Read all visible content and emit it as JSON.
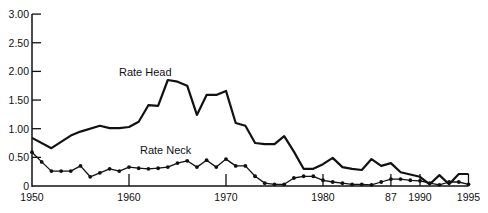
{
  "chart_data": {
    "type": "line",
    "title": "",
    "xlabel": "",
    "ylabel": "",
    "xlim": [
      1950,
      1995
    ],
    "ylim": [
      0,
      3.0
    ],
    "grid": false,
    "legend_position": "inline labels",
    "y_ticks": [
      "0",
      "0.50",
      "1.00",
      "1.50",
      "2.00",
      "2.50",
      "3.00"
    ],
    "x_ticks": [
      {
        "year": 1950,
        "label": "1950"
      },
      {
        "year": 1960,
        "label": "1960"
      },
      {
        "year": 1970,
        "label": "1970"
      },
      {
        "year": 1980,
        "label": "1980"
      },
      {
        "year": 1987,
        "label": "87"
      },
      {
        "year": 1990,
        "label": "1990"
      },
      {
        "year": 1995,
        "label": "1995"
      }
    ],
    "series": [
      {
        "name": "Rate Head",
        "markers": false,
        "x": [
          1950,
          1952,
          1954,
          1955,
          1957,
          1958,
          1959,
          1960,
          1961,
          1962,
          1963,
          1964,
          1965,
          1966,
          1967,
          1968,
          1969,
          1970,
          1971,
          1972,
          1973,
          1974,
          1975,
          1976,
          1977,
          1978,
          1979,
          1980,
          1981,
          1982,
          1983,
          1984,
          1985,
          1986,
          1987,
          1988,
          1989,
          1990,
          1991,
          1992,
          1993,
          1994,
          1995
        ],
        "values": [
          0.84,
          0.66,
          0.88,
          0.95,
          1.05,
          1.01,
          1.01,
          1.03,
          1.12,
          1.41,
          1.4,
          1.85,
          1.82,
          1.75,
          1.24,
          1.59,
          1.59,
          1.66,
          1.1,
          1.05,
          0.75,
          0.73,
          0.73,
          0.87,
          0.6,
          0.3,
          0.3,
          0.38,
          0.49,
          0.33,
          0.3,
          0.28,
          0.47,
          0.35,
          0.4,
          0.24,
          0.2,
          0.16,
          0.03,
          0.19,
          0.03,
          0.21,
          0.21
        ]
      },
      {
        "name": "Rate Neck",
        "markers": true,
        "x": [
          1950,
          1951,
          1952,
          1953,
          1954,
          1955,
          1956,
          1957,
          1958,
          1959,
          1960,
          1961,
          1962,
          1963,
          1964,
          1965,
          1966,
          1967,
          1968,
          1969,
          1970,
          1971,
          1972,
          1973,
          1974,
          1975,
          1976,
          1977,
          1978,
          1979,
          1980,
          1981,
          1982,
          1983,
          1984,
          1985,
          1986,
          1987,
          1988,
          1989,
          1990,
          1991,
          1992,
          1993,
          1994,
          1995
        ],
        "values": [
          0.59,
          0.42,
          0.26,
          0.26,
          0.26,
          0.35,
          0.16,
          0.23,
          0.3,
          0.26,
          0.33,
          0.31,
          0.3,
          0.31,
          0.33,
          0.4,
          0.44,
          0.33,
          0.45,
          0.33,
          0.47,
          0.35,
          0.35,
          0.17,
          0.05,
          0.03,
          0.03,
          0.14,
          0.17,
          0.17,
          0.1,
          0.07,
          0.05,
          0.03,
          0.03,
          0.02,
          0.07,
          0.12,
          0.12,
          0.1,
          0.09,
          0.05,
          0.02,
          0.07,
          0.07,
          0.03
        ]
      }
    ],
    "annotations": [
      {
        "text": "Rate Head",
        "year": 1959,
        "value": 2.0
      },
      {
        "text": "Rate Neck",
        "year": 1961,
        "value": 0.66
      }
    ]
  },
  "labels": {
    "head": "Rate Head",
    "neck": "Rate Neck"
  },
  "colors": {
    "line": "#111111",
    "background": "#ffffff"
  }
}
